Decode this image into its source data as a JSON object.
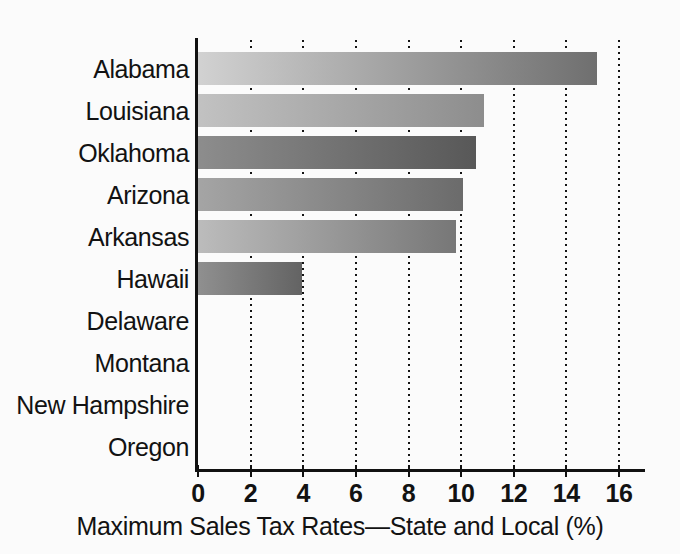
{
  "chart_data": {
    "type": "bar",
    "orientation": "horizontal",
    "title": "",
    "subtitle": "",
    "xlabel": "Maximum Sales Tax Rates—State and Local (%)",
    "ylabel": "",
    "xlim": [
      0,
      16
    ],
    "xticks": [
      0,
      2,
      4,
      6,
      8,
      10,
      12,
      14,
      16
    ],
    "xtick_labels": [
      "0",
      "2",
      "4",
      "6",
      "8",
      "10",
      "12",
      "14",
      "16"
    ],
    "grid": "vertical-dotted",
    "legend": "none",
    "categories": [
      "Alabama",
      "Louisiana",
      "Oklahoma",
      "Arizona",
      "Arkansas",
      "Hawaii",
      "Delaware",
      "Montana",
      "New Hampshire",
      "Oregon"
    ],
    "values": [
      15.2,
      10.9,
      10.6,
      10.1,
      9.85,
      4.0,
      0,
      0,
      0,
      0
    ],
    "bars": [
      {
        "label": "Alabama",
        "value": 15.2,
        "fill_start": "#d2d2d2",
        "fill_end": "#6f6f6f"
      },
      {
        "label": "Louisiana",
        "value": 10.9,
        "fill_start": "#c2c2c2",
        "fill_end": "#8d8d8d"
      },
      {
        "label": "Oklahoma",
        "value": 10.6,
        "fill_start": "#8d8d8d",
        "fill_end": "#585858"
      },
      {
        "label": "Arizona",
        "value": 10.1,
        "fill_start": "#a5a5a5",
        "fill_end": "#6b6b6b"
      },
      {
        "label": "Arkansas",
        "value": 9.85,
        "fill_start": "#bcbcbc",
        "fill_end": "#777777"
      },
      {
        "label": "Hawaii",
        "value": 4.0,
        "fill_start": "#909090",
        "fill_end": "#636363"
      },
      {
        "label": "Delaware",
        "value": 0,
        "fill_start": "#bdbdbd",
        "fill_end": "#7a7a7a"
      },
      {
        "label": "Montana",
        "value": 0,
        "fill_start": "#bdbdbd",
        "fill_end": "#7a7a7a"
      },
      {
        "label": "New Hampshire",
        "value": 0,
        "fill_start": "#bdbdbd",
        "fill_end": "#7a7a7a"
      },
      {
        "label": "Oregon",
        "value": 0,
        "fill_start": "#bdbdbd",
        "fill_end": "#7a7a7a"
      }
    ]
  },
  "colors": {
    "background": "#fbfbfb",
    "axis": "#111111",
    "grid": "#141414",
    "text": "#121212"
  }
}
